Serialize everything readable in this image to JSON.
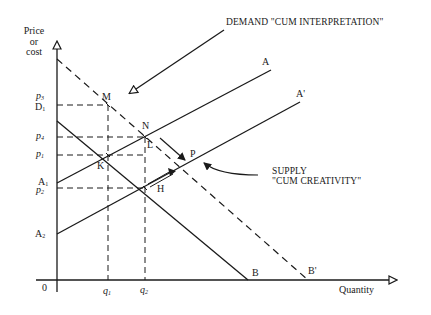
{
  "diagram": {
    "type": "supply-demand",
    "y_axis": {
      "label_line1": "Price",
      "label_line2": "or",
      "label_line3": "cost"
    },
    "x_axis": {
      "label": "Quantity",
      "origin": "0"
    },
    "y_ticks": {
      "p3": {
        "base": "p",
        "sub": "3"
      },
      "D1": {
        "base": "D",
        "sub": "1"
      },
      "p4": {
        "base": "p",
        "sub": "4"
      },
      "p1": {
        "base": "p",
        "sub": "1"
      },
      "A1": {
        "base": "A",
        "sub": "1"
      },
      "p2": {
        "base": "p",
        "sub": "2"
      },
      "A2": {
        "base": "A",
        "sub": "2"
      }
    },
    "x_ticks": {
      "q1": {
        "base": "q",
        "sub": "1"
      },
      "q2": {
        "base": "q",
        "sub": "2"
      }
    },
    "points": {
      "M": "M",
      "N": "N",
      "L": "L",
      "K": "K",
      "H": "H",
      "P": "P",
      "B": "B",
      "B_prime": "B'",
      "A": "A",
      "A_prime": "A'"
    },
    "annotations": {
      "demand": "DEMAND \"CUM INTERPRETATION\"",
      "supply_line1": "SUPPLY",
      "supply_line2": "\"CUM CREATIVITY\""
    },
    "curves": [
      {
        "name": "Supply A1-A",
        "style": "solid",
        "from": [
          57,
          183
        ],
        "to": [
          271,
          70
        ]
      },
      {
        "name": "Supply A2-A'",
        "style": "solid",
        "from": [
          57,
          234
        ],
        "to": [
          300,
          102
        ]
      },
      {
        "name": "Demand D1-B",
        "style": "solid",
        "from": [
          57,
          121
        ],
        "to": [
          248,
          280
        ]
      },
      {
        "name": "Demand shifted (to B')",
        "style": "dashed",
        "from": [
          57,
          59
        ],
        "to": [
          308,
          280
        ]
      }
    ],
    "colors": {
      "ink": "#1a1a1a",
      "background": "#ffffff"
    }
  }
}
